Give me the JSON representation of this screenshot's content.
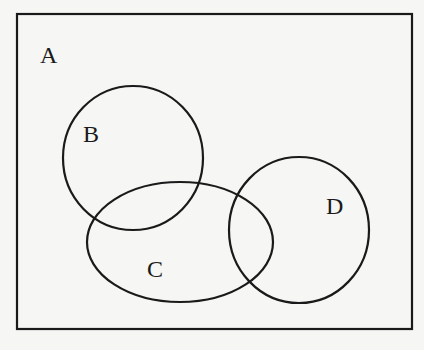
{
  "diagram": {
    "type": "venn",
    "universe": {
      "label": "A"
    },
    "sets": [
      {
        "label": "B",
        "shape": "circle"
      },
      {
        "label": "C",
        "shape": "ellipse"
      },
      {
        "label": "D",
        "shape": "circle"
      }
    ],
    "colors": {
      "stroke": "#1a1a1a",
      "background": "#f6f6f4"
    }
  }
}
